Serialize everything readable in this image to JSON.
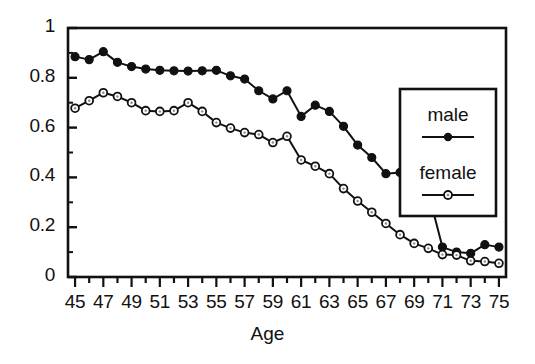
{
  "chart_data": {
    "type": "line",
    "title": "",
    "xlabel": "Age",
    "ylabel": "",
    "xlim": [
      44.5,
      75.5
    ],
    "ylim": [
      0,
      1
    ],
    "grid": false,
    "legend_position": "right",
    "x": [
      45,
      46,
      47,
      48,
      49,
      50,
      51,
      52,
      53,
      54,
      55,
      56,
      57,
      58,
      59,
      60,
      61,
      62,
      63,
      64,
      65,
      66,
      67,
      68,
      69,
      70,
      71,
      72,
      73,
      74,
      75
    ],
    "xticks": [
      45,
      47,
      49,
      51,
      53,
      55,
      57,
      59,
      61,
      63,
      65,
      67,
      69,
      71,
      73,
      75
    ],
    "xtick_labels": [
      "45",
      "47",
      "49",
      "51",
      "53",
      "55",
      "57",
      "59",
      "61",
      "63",
      "65",
      "67",
      "69",
      "71",
      "73",
      "75"
    ],
    "xminor_ticks": [
      45,
      46,
      47,
      48,
      49,
      50,
      51,
      52,
      53,
      54,
      55,
      56,
      57,
      58,
      59,
      60,
      61,
      62,
      63,
      64,
      65,
      66,
      67,
      68,
      69,
      70,
      71,
      72,
      73,
      74,
      75
    ],
    "yticks": [
      0,
      0.2,
      0.4,
      0.6,
      0.8,
      1
    ],
    "ytick_labels": [
      "0",
      "0.2",
      "0.4",
      "0.6",
      "0.8",
      "1"
    ],
    "yminor_ticks": [
      0.1,
      0.3,
      0.5,
      0.7,
      0.9
    ],
    "series": [
      {
        "name": "male",
        "marker": "filled-circle",
        "color": "#111111",
        "values": [
          0.885,
          0.873,
          0.905,
          0.862,
          0.845,
          0.835,
          0.83,
          0.828,
          0.827,
          0.828,
          0.83,
          0.808,
          0.795,
          0.748,
          0.715,
          0.748,
          0.645,
          0.69,
          0.665,
          0.605,
          0.53,
          0.48,
          0.415,
          0.42,
          0.335,
          0.34,
          0.12,
          0.1,
          0.095,
          0.13,
          0.12
        ]
      },
      {
        "name": "female",
        "marker": "open-circle",
        "color": "#111111",
        "values": [
          0.678,
          0.708,
          0.74,
          0.725,
          0.7,
          0.668,
          0.665,
          0.668,
          0.7,
          0.665,
          0.62,
          0.598,
          0.58,
          0.572,
          0.54,
          0.565,
          0.47,
          0.445,
          0.415,
          0.355,
          0.305,
          0.26,
          0.215,
          0.17,
          0.135,
          0.115,
          0.09,
          0.088,
          0.065,
          0.062,
          0.055
        ]
      }
    ],
    "male_tail": {
      "x": [
        45,
        46,
        47,
        48,
        49,
        50,
        51,
        52,
        53,
        54,
        55,
        56,
        57,
        58,
        59,
        60,
        61,
        62,
        63,
        64,
        65,
        66,
        67,
        68,
        69,
        70,
        71,
        72,
        73,
        74,
        75
      ],
      "values": [
        0.885,
        0.873,
        0.905,
        0.862,
        0.845,
        0.835,
        0.83,
        0.828,
        0.827,
        0.828,
        0.83,
        0.808,
        0.795,
        0.748,
        0.715,
        0.748,
        0.645,
        0.69,
        0.665,
        0.605,
        0.53,
        0.48,
        0.415,
        0.42,
        0.335,
        0.34,
        0.12,
        0.1,
        0.095,
        0.13,
        0.12
      ]
    },
    "annotations": []
  },
  "axis": {
    "xlabel": "Age",
    "ytick_labels": [
      "1",
      "0.8",
      "0.6",
      "0.4",
      "0.2",
      "0"
    ],
    "xtick_labels": [
      "45",
      "47",
      "49",
      "51",
      "53",
      "55",
      "57",
      "59",
      "61",
      "63",
      "65",
      "67",
      "69",
      "71",
      "73",
      "75"
    ]
  },
  "legend": {
    "items": [
      {
        "label": "male",
        "marker": "filled-circle"
      },
      {
        "label": "female",
        "marker": "open-circle"
      }
    ]
  }
}
